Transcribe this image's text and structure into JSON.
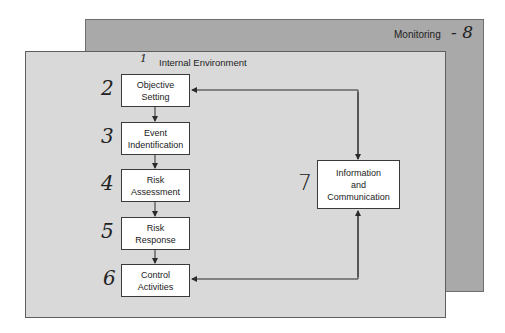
{
  "diagram": {
    "outer_layer": {
      "label": "Monitoring",
      "annotation": "- 8"
    },
    "inner_layer": {
      "label": "Internal Environment",
      "annotation": "1"
    },
    "components": [
      {
        "id": "objective",
        "label": "Objective\nSetting",
        "annotation": "2"
      },
      {
        "id": "event",
        "label": "Event\nIndentification",
        "annotation": "3"
      },
      {
        "id": "assessment",
        "label": "Risk\nAssessment",
        "annotation": "4"
      },
      {
        "id": "response",
        "label": "Risk\nResponse",
        "annotation": "5"
      },
      {
        "id": "control",
        "label": "Control\nActivities",
        "annotation": "6"
      },
      {
        "id": "info",
        "label": "Information\nand\nCommunication",
        "annotation": "7"
      }
    ],
    "colors": {
      "outer": "#a9a9a9",
      "inner": "#d9d9d9",
      "box": "#ffffff",
      "line": "#3a3a3a"
    }
  }
}
